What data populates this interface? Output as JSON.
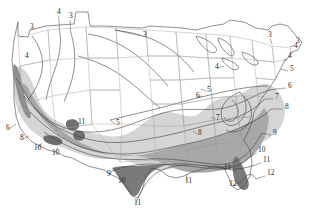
{
  "map": {
    "title": "USDA Plant Hardiness Zone Map of the Contiguous United States",
    "type": "choropleth-isoline-zone-map",
    "region": "Contiguous United States",
    "background_color": "#ffffff",
    "outline_color": "#4a4a4a",
    "state_border_color": "#9a9a9a",
    "isoline_color": "#3c3c3c",
    "label_color": "#2b2b2b",
    "zone_fills": [
      {
        "zone": "3-5",
        "color": "#ffffff",
        "name": "unshaded-north"
      },
      {
        "zone": "6-8",
        "color": "#d5d5d5",
        "name": "light-gray-band"
      },
      {
        "zone": "9-11",
        "color": "#a8a8a8",
        "name": "medium-gray-band"
      },
      {
        "zone": "11-12",
        "color": "#7a7a7a",
        "name": "dark-gray-band"
      }
    ],
    "zone_range": [
      3,
      12
    ],
    "labels": [
      {
        "id": "l01",
        "text": "3",
        "x": 30,
        "y": 29,
        "leader": null
      },
      {
        "id": "l02",
        "text": "4",
        "x": 57,
        "y": 14,
        "leader": [
          [
            58.5,
            16
          ],
          [
            59.5,
            27
          ]
        ]
      },
      {
        "id": "l03",
        "text": "3",
        "x": 69,
        "y": 18,
        "leader": [
          [
            70,
            20
          ],
          [
            70.5,
            30
          ]
        ]
      },
      {
        "id": "l04",
        "text": "4",
        "x": 25,
        "y": 58,
        "leader": null
      },
      {
        "id": "l05",
        "text": "3",
        "x": 143,
        "y": 37,
        "leader": [
          [
            141.5,
            36
          ],
          [
            115,
            30
          ]
        ]
      },
      {
        "id": "l06",
        "text": "3",
        "x": 268,
        "y": 37,
        "leader": [
          [
            270,
            39
          ],
          [
            272,
            44
          ]
        ]
      },
      {
        "id": "l07",
        "text": "3",
        "x": 296,
        "y": 43,
        "leader": [
          [
            295,
            45
          ],
          [
            290,
            47
          ]
        ]
      },
      {
        "id": "l08",
        "text": "4",
        "x": 294,
        "y": 48,
        "leader": null
      },
      {
        "id": "l09",
        "text": "4",
        "x": 215,
        "y": 69,
        "leader": [
          [
            217,
            68
          ],
          [
            224,
            66
          ]
        ]
      },
      {
        "id": "l10",
        "text": "4",
        "x": 288,
        "y": 58,
        "leader": [
          [
            287,
            59
          ],
          [
            283,
            61
          ]
        ]
      },
      {
        "id": "l11",
        "text": "5",
        "x": 290,
        "y": 71,
        "leader": [
          [
            288,
            71
          ],
          [
            281,
            69
          ]
        ]
      },
      {
        "id": "l12",
        "text": "5",
        "x": 207,
        "y": 92,
        "leader": [
          [
            206,
            91
          ],
          [
            201,
            89
          ]
        ]
      },
      {
        "id": "l13",
        "text": "6",
        "x": 196,
        "y": 98,
        "leader": [
          [
            197,
            97
          ],
          [
            202,
            96
          ]
        ]
      },
      {
        "id": "l14",
        "text": "6",
        "x": 288,
        "y": 88,
        "leader": [
          [
            286,
            88
          ],
          [
            276,
            89
          ]
        ]
      },
      {
        "id": "l15",
        "text": "7",
        "x": 275,
        "y": 99,
        "leader": [
          [
            273,
            99
          ],
          [
            265,
            99
          ]
        ]
      },
      {
        "id": "l16",
        "text": "8",
        "x": 285,
        "y": 109,
        "leader": [
          [
            283,
            109
          ],
          [
            271,
            109
          ]
        ]
      },
      {
        "id": "l17",
        "text": "7",
        "x": 216,
        "y": 120,
        "leader": [
          [
            215,
            119
          ],
          [
            211,
            117
          ]
        ]
      },
      {
        "id": "l18",
        "text": "5",
        "x": 116,
        "y": 125,
        "leader": [
          [
            115,
            124
          ],
          [
            110,
            120
          ]
        ]
      },
      {
        "id": "l19",
        "text": "8",
        "x": 198,
        "y": 135,
        "leader": [
          [
            197,
            134
          ],
          [
            193,
            131
          ]
        ]
      },
      {
        "id": "l20",
        "text": "9",
        "x": 273,
        "y": 135,
        "leader": [
          [
            271,
            135
          ],
          [
            262,
            133
          ]
        ]
      },
      {
        "id": "l21",
        "text": "11",
        "x": 78,
        "y": 124,
        "leader": null
      },
      {
        "id": "l22",
        "text": "6",
        "x": 6,
        "y": 130,
        "leader": [
          [
            9,
            129
          ],
          [
            16,
            124
          ]
        ]
      },
      {
        "id": "l23",
        "text": "8",
        "x": 20,
        "y": 140,
        "leader": [
          [
            23,
            139
          ],
          [
            29,
            136
          ]
        ]
      },
      {
        "id": "l24",
        "text": "10",
        "x": 34,
        "y": 150,
        "leader": [
          [
            37,
            148
          ],
          [
            42,
            143
          ]
        ]
      },
      {
        "id": "l25",
        "text": "10",
        "x": 52,
        "y": 155,
        "leader": [
          [
            54,
            153
          ],
          [
            58,
            148
          ]
        ]
      },
      {
        "id": "l26",
        "text": "9",
        "x": 107,
        "y": 176,
        "leader": [
          [
            109,
            175
          ],
          [
            112,
            171
          ]
        ]
      },
      {
        "id": "l27",
        "text": "10",
        "x": 118,
        "y": 183,
        "leader": [
          [
            120,
            182
          ],
          [
            124,
            178
          ]
        ]
      },
      {
        "id": "l28",
        "text": "11",
        "x": 134,
        "y": 205,
        "leader": [
          [
            136,
            203
          ],
          [
            139,
            196
          ]
        ]
      },
      {
        "id": "l29",
        "text": "11",
        "x": 185,
        "y": 183,
        "leader": [
          [
            186,
            181
          ],
          [
            187,
            174
          ]
        ]
      },
      {
        "id": "l30",
        "text": "10",
        "x": 258,
        "y": 152,
        "leader": [
          [
            257,
            153
          ],
          [
            251,
            156
          ]
        ]
      },
      {
        "id": "l31",
        "text": "11",
        "x": 263,
        "y": 162,
        "leader": [
          [
            261,
            163
          ],
          [
            255,
            165
          ]
        ]
      },
      {
        "id": "l32",
        "text": "11",
        "x": 224,
        "y": 170,
        "leader": [
          [
            230,
            170
          ],
          [
            237,
            170
          ]
        ]
      },
      {
        "id": "l33",
        "text": "12",
        "x": 267,
        "y": 175,
        "leader": [
          [
            265,
            176
          ],
          [
            256,
            179
          ]
        ]
      },
      {
        "id": "l34",
        "text": "12",
        "x": 229,
        "y": 186,
        "leader": [
          [
            234,
            185
          ],
          [
            241,
            182
          ]
        ]
      }
    ]
  }
}
